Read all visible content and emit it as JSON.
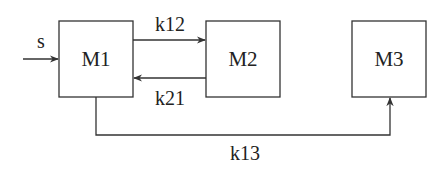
{
  "diagram": {
    "type": "compartment-model",
    "nodes": [
      {
        "id": "M1",
        "label": "M1"
      },
      {
        "id": "M2",
        "label": "M2"
      },
      {
        "id": "M3",
        "label": "M3"
      }
    ],
    "edges": [
      {
        "from": "input",
        "to": "M1",
        "label": "s"
      },
      {
        "from": "M1",
        "to": "M2",
        "label": "k12"
      },
      {
        "from": "M2",
        "to": "M1",
        "label": "k21"
      },
      {
        "from": "M1",
        "to": "M3",
        "label": "k13"
      }
    ]
  },
  "colors": {
    "stroke": "#333333",
    "text": "#222222",
    "background": "#ffffff"
  }
}
